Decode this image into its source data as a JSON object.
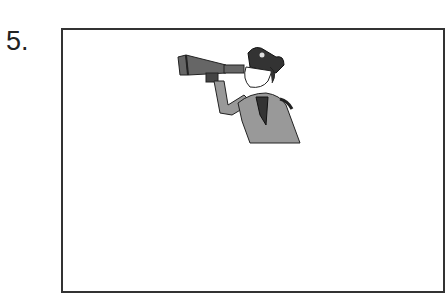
{
  "item": {
    "number_label": "5.",
    "image": {
      "icon": "pirate-with-telescope-illustration",
      "description": "Cartoon pirate looking through a telescope"
    }
  }
}
